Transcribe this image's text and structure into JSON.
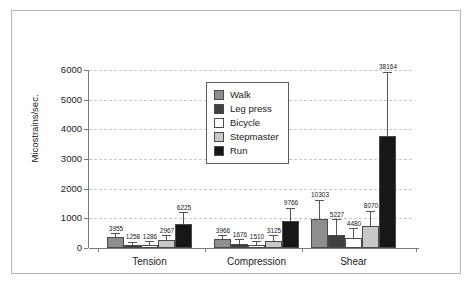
{
  "chart_data": {
    "type": "bar",
    "title": "",
    "xlabel": "",
    "ylabel": "Micostrains/sec.",
    "ylim": [
      0,
      6000
    ],
    "yticks": [
      0,
      1000,
      2000,
      3000,
      4000,
      5000,
      6000
    ],
    "ytick_labels": [
      "0",
      "1000",
      "2000",
      "3000",
      "4000",
      "5000",
      "6000"
    ],
    "grid": "horizontal-dashed",
    "legend_position": "upper-center",
    "categories": [
      "Tension",
      "Compression",
      "Shear"
    ],
    "series": [
      {
        "name": "Walk",
        "color": "#8e8e8e",
        "values": [
          370,
          300,
          975
        ],
        "error_high": [
          470,
          400,
          1590
        ],
        "labels": [
          "3955",
          "3966",
          "10303"
        ]
      },
      {
        "name": "Leg press",
        "color": "#3f3f3f",
        "values": [
          90,
          125,
          450
        ],
        "error_high": [
          175,
          260,
          930
        ],
        "labels": [
          "1258",
          "1676",
          "5227"
        ]
      },
      {
        "name": "Bicycle",
        "color": "#ffffff",
        "values": [
          110,
          105,
          350
        ],
        "error_high": [
          200,
          190,
          640
        ],
        "labels": [
          "1286",
          "1510",
          "4480"
        ]
      },
      {
        "name": "Stepmaster",
        "color": "#c8c8c8",
        "values": [
          270,
          250,
          740
        ],
        "error_high": [
          400,
          390,
          1230
        ],
        "labels": [
          "2967",
          "3125",
          "8070"
        ]
      },
      {
        "name": "Run",
        "color": "#171717",
        "values": [
          810,
          925,
          3780
        ],
        "error_high": [
          1180,
          1330,
          5900
        ],
        "labels": [
          "6225",
          "9766",
          "38164"
        ]
      }
    ]
  },
  "legend": {
    "items": [
      {
        "label": "Walk"
      },
      {
        "label": "Leg press"
      },
      {
        "label": "Bicycle"
      },
      {
        "label": "Stepmaster"
      },
      {
        "label": "Run"
      }
    ]
  }
}
